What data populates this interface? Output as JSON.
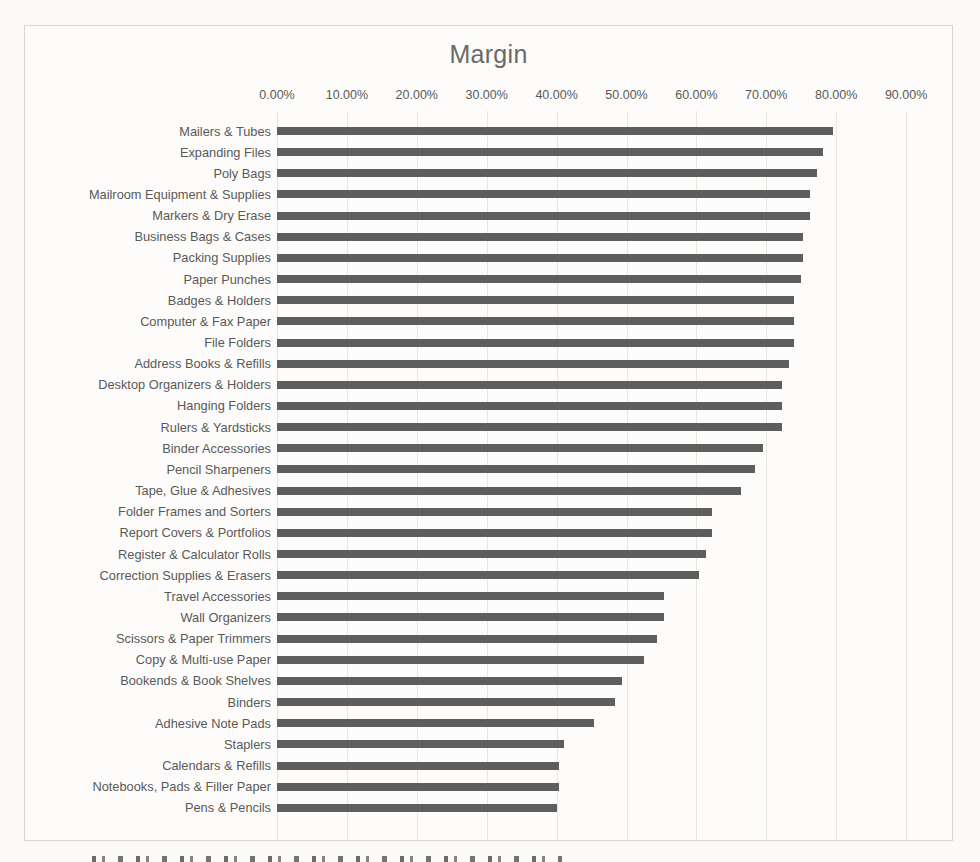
{
  "page": {
    "background_color": "#fbfaf7",
    "frame_border_color": "#d8d6d0",
    "bar_color": "#5e5e5e",
    "grid_color": "#e7e6e1",
    "text_color": "#595959",
    "title_color": "#696969"
  },
  "chart_data": {
    "type": "bar",
    "orientation": "horizontal",
    "title": "Margin",
    "xlabel": "",
    "ylabel": "",
    "xlim": [
      0,
      90
    ],
    "grid": true,
    "legend": false,
    "x_tick_labels": [
      "0.00%",
      "10.00%",
      "20.00%",
      "30.00%",
      "40.00%",
      "50.00%",
      "60.00%",
      "70.00%",
      "80.00%",
      "90.00%"
    ],
    "x_tick_values": [
      0,
      10,
      20,
      30,
      40,
      50,
      60,
      70,
      80,
      90
    ],
    "categories": [
      "Mailers & Tubes",
      "Expanding Files",
      "Poly Bags",
      "Mailroom Equipment & Supplies",
      "Markers & Dry Erase",
      "Business Bags & Cases",
      "Packing Supplies",
      "Paper Punches",
      "Badges & Holders",
      "Computer & Fax Paper",
      "File Folders",
      "Address Books & Refills",
      "Desktop Organizers & Holders",
      "Hanging Folders",
      "Rulers & Yardsticks",
      "Binder Accessories",
      "Pencil Sharpeners",
      "Tape, Glue & Adhesives",
      "Folder Frames and Sorters",
      "Report Covers & Portfolios",
      "Register & Calculator Rolls",
      "Correction Supplies & Erasers",
      "Travel Accessories",
      "Wall Organizers",
      "Scissors & Paper Trimmers",
      "Copy & Multi-use Paper",
      "Bookends & Book Shelves",
      "Binders",
      "Adhesive Note Pads",
      "Staplers",
      "Calendars & Refills",
      "Notebooks, Pads & Filler Paper",
      "Pens & Pencils"
    ],
    "values": [
      79.5,
      78.1,
      77.2,
      76.2,
      76.2,
      75.3,
      75.3,
      75.0,
      74.0,
      73.9,
      73.9,
      73.2,
      72.3,
      72.3,
      72.2,
      69.5,
      68.4,
      66.4,
      62.3,
      62.3,
      61.4,
      60.4,
      55.4,
      55.4,
      54.4,
      52.5,
      49.3,
      48.4,
      45.3,
      41.1,
      40.4,
      40.4,
      40.1
    ],
    "value_unit": "%"
  }
}
